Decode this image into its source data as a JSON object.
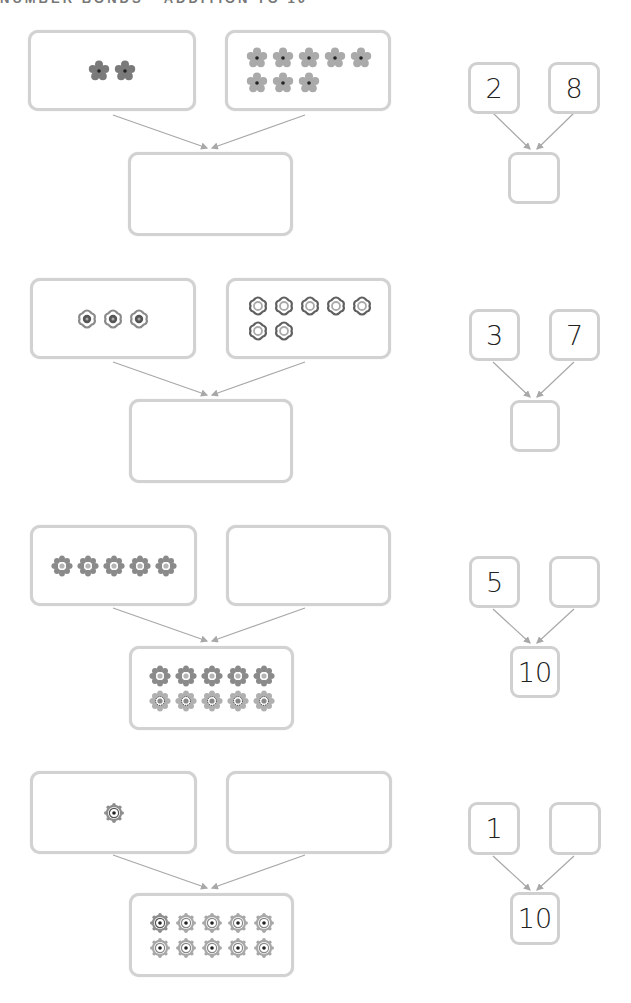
{
  "title": "NUMBER BONDS - ADDITION TO 10",
  "colors": {
    "box_border": "#d2d2d2",
    "arrow": "#a8a8a8",
    "flower_dark": "#7a7a7a",
    "flower_light": "#a9a9a9",
    "text": "#222222"
  },
  "problems": [
    {
      "left_group": {
        "count": 2,
        "style": "daisy-dark"
      },
      "right_group": {
        "count": 8,
        "style": "daisy-light"
      },
      "total_group": {
        "count": 0,
        "style": "none"
      },
      "bond": {
        "part_a": "2",
        "part_b": "8",
        "whole": ""
      }
    },
    {
      "left_group": {
        "count": 3,
        "style": "ring-dark"
      },
      "right_group": {
        "count": 7,
        "style": "ring-light"
      },
      "total_group": {
        "count": 0,
        "style": "none"
      },
      "bond": {
        "part_a": "3",
        "part_b": "7",
        "whole": ""
      }
    },
    {
      "left_group": {
        "count": 5,
        "style": "heart-petal"
      },
      "right_group": {
        "count": 0,
        "style": "none"
      },
      "total_group": {
        "count": 10,
        "style": "heart-petal",
        "rows": [
          5,
          5
        ]
      },
      "bond": {
        "part_a": "5",
        "part_b": "",
        "whole": "10"
      }
    },
    {
      "left_group": {
        "count": 1,
        "style": "gear-target"
      },
      "right_group": {
        "count": 0,
        "style": "none"
      },
      "total_group": {
        "count": 10,
        "style": "gear-target",
        "rows": [
          5,
          5
        ]
      },
      "bond": {
        "part_a": "1",
        "part_b": "",
        "whole": "10"
      }
    }
  ]
}
